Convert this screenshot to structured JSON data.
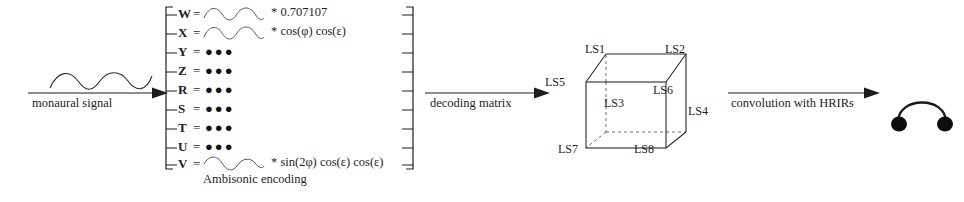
{
  "diagram": {
    "background": "#ffffff",
    "ink": "#1d1d1d"
  },
  "input_stage": {
    "label": "monaural signal",
    "wave_icon": "sine-wave-icon",
    "arrow_icon": "arrow-right-icon"
  },
  "encoding_stage": {
    "caption": "Ambisonic encoding",
    "bracket_icon": "left-bracket",
    "channels": [
      {
        "name": "W",
        "eq": "=",
        "content": "wave",
        "formula": "* 0.707107"
      },
      {
        "name": "X",
        "eq": "=",
        "content": "wave",
        "formula": "* cos(φ) cos(ε)"
      },
      {
        "name": "Y",
        "eq": "=",
        "content": "dots",
        "formula": ""
      },
      {
        "name": "Z",
        "eq": "=",
        "content": "dots",
        "formula": ""
      },
      {
        "name": "R",
        "eq": "=",
        "content": "dots",
        "formula": ""
      },
      {
        "name": "S",
        "eq": "=",
        "content": "dots",
        "formula": ""
      },
      {
        "name": "T",
        "eq": "=",
        "content": "dots",
        "formula": ""
      },
      {
        "name": "U",
        "eq": "=",
        "content": "dots",
        "formula": ""
      },
      {
        "name": "V",
        "eq": "=",
        "content": "wave",
        "formula": "* sin(2φ) cos(ε) cos(ε)"
      }
    ],
    "dots_glyph": "●●●"
  },
  "decoding_stage": {
    "label": "decoding matrix",
    "bracket_icon": "right-bracket",
    "arrow_icon": "arrow-right-icon"
  },
  "loudspeaker_stage": {
    "shape": "cube",
    "speakers": [
      {
        "id": "LS1",
        "label": "LS1"
      },
      {
        "id": "LS2",
        "label": "LS2"
      },
      {
        "id": "LS3",
        "label": "LS3"
      },
      {
        "id": "LS4",
        "label": "LS4"
      },
      {
        "id": "LS5",
        "label": "LS5"
      },
      {
        "id": "LS6",
        "label": "LS6"
      },
      {
        "id": "LS7",
        "label": "LS7"
      },
      {
        "id": "LS8",
        "label": "LS8"
      }
    ]
  },
  "hrir_stage": {
    "label": "convolution with HRIRs",
    "arrow_icon": "arrow-right-icon"
  },
  "output_stage": {
    "icon": "headphones-icon"
  }
}
